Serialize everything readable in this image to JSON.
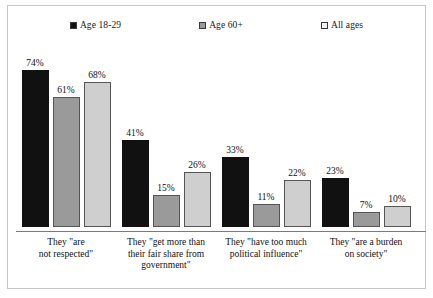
{
  "chart_data": {
    "type": "bar",
    "title": "",
    "subtitle": "",
    "xlabel": "",
    "ylabel": "",
    "ylim": [
      0,
      80
    ],
    "grid": false,
    "legend_position": "top",
    "categories": [
      "They \"are not respected\"",
      "They \"get more than their fair share from government\"",
      "They \"have too much political influence\"",
      "They \"are a burden on society\""
    ],
    "series": [
      {
        "name": "Age 18-29",
        "color": "#111111",
        "values": [
          74,
          41,
          33,
          23
        ],
        "labels": [
          "74%",
          "41%",
          "33%",
          "23%"
        ]
      },
      {
        "name": "Age 60+",
        "color": "#9a9a9a",
        "values": [
          61,
          15,
          11,
          7
        ],
        "labels": [
          "61%",
          "15%",
          "11%",
          "7%"
        ]
      },
      {
        "name": "All ages",
        "color": "#cfcfcf",
        "values": [
          68,
          26,
          22,
          10
        ],
        "labels": [
          "68%",
          "26%",
          "22%",
          "10%"
        ]
      }
    ]
  },
  "legend": {
    "items": [
      {
        "label": "Age 18-29",
        "swatch": "filled-black-square-icon"
      },
      {
        "label": "Age 60+",
        "swatch": "filled-gray-square-icon"
      },
      {
        "label": "All ages",
        "swatch": "outlined-square-icon"
      }
    ]
  },
  "axis": {
    "labels": [
      "They \"are\nnot respected\"",
      "They \"get more than\ntheir fair share from\ngovernment\"",
      "They \"have too much\npolitical influence\"",
      "They \"are a burden\non society\""
    ]
  },
  "colors": {
    "series_18_29": "#111111",
    "series_60_plus": "#9a9a9a",
    "series_all_ages": "#cfcfcf",
    "frame": "#c8c8c8",
    "axis": "#7a7a7a",
    "background": "#ffffff"
  }
}
